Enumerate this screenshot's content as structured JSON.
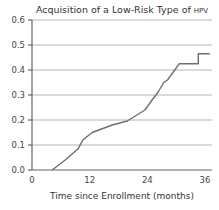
{
  "chart_data": {
    "type": "line",
    "title": "Acquisition of a Low-Risk Type of",
    "title_suffix": "HPV",
    "xlabel": "Time since Enrollment (months)",
    "ylabel": "",
    "xlim": [
      0,
      37
    ],
    "ylim": [
      0,
      0.6
    ],
    "xticks": [
      0,
      12,
      24,
      36
    ],
    "xtick_labels": [
      "0",
      "12",
      "24",
      "36"
    ],
    "yticks": [
      0.0,
      0.1,
      0.2,
      0.3,
      0.4,
      0.5,
      0.6
    ],
    "ytick_labels": [
      "0.0",
      "0.1",
      "0.2",
      "0.3",
      "0.4",
      "0.5",
      "0.6"
    ],
    "grid": "horizontal",
    "legend": "none",
    "series": [
      {
        "name": "Cumulative incidence",
        "color": "#6e6e6e",
        "x": [
          4.2,
          6.9,
          9.6,
          10.6,
          12.5,
          16.7,
          19.8,
          23.5,
          25.0,
          26.2,
          27.4,
          28.2,
          30.6,
          34.6,
          34.6,
          37.0
        ],
        "y": [
          0.0,
          0.04,
          0.085,
          0.12,
          0.15,
          0.18,
          0.196,
          0.24,
          0.28,
          0.31,
          0.35,
          0.36,
          0.425,
          0.425,
          0.465,
          0.465
        ]
      }
    ]
  }
}
